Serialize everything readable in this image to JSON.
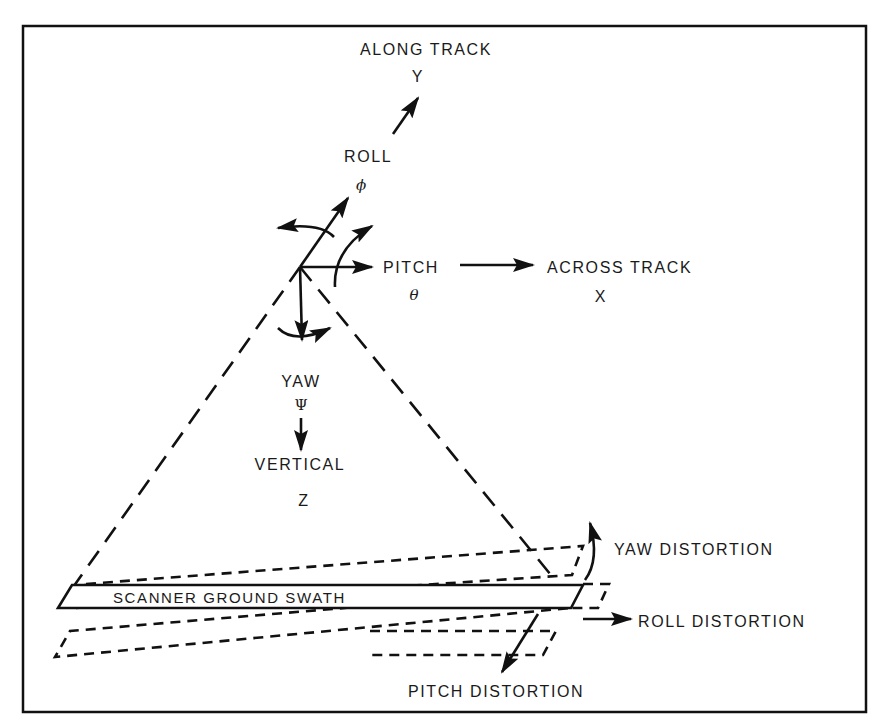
{
  "diagram": {
    "axes": {
      "along_track": {
        "label": "ALONG TRACK",
        "symbol": "Y"
      },
      "roll": {
        "label": "ROLL",
        "symbol": "ϕ"
      },
      "pitch": {
        "label": "PITCH",
        "symbol": "θ"
      },
      "across_track": {
        "label": "ACROSS TRACK",
        "symbol": "X"
      },
      "yaw": {
        "label": "YAW",
        "symbol": "Ψ"
      },
      "vertical": {
        "label": "VERTICAL",
        "symbol": "Z"
      }
    },
    "swath": {
      "label": "SCANNER GROUND SWATH"
    },
    "distortions": {
      "yaw": "YAW DISTORTION",
      "roll": "ROLL DISTORTION",
      "pitch": "PITCH DISTORTION"
    },
    "colors": {
      "ink": "#111111",
      "background": "#ffffff"
    }
  }
}
